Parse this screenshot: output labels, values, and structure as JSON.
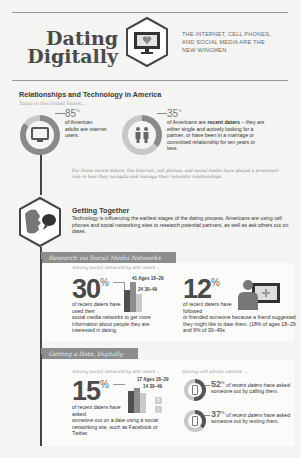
{
  "header": {
    "title_line1": "Dating",
    "title_line2": "Digitally",
    "logo_icon": "monitor-heart-icon",
    "tagline_line1": "THE INTERNET, CELL PHONES,",
    "tagline_line2": "AND SOCIAL MEDIA ARE THE",
    "tagline_line3": "NEW WINGMEN"
  },
  "section1": {
    "title": "Relationships and Technology in America",
    "subtitle": "Today in the United States...",
    "stat1": {
      "value": "85",
      "unit": "%",
      "icon": "monitor-icon",
      "text": "of American adults are internet users."
    },
    "stat2": {
      "value": "35",
      "unit": "%",
      "icon": "couple-icon",
      "text_pre": "of Americans are ",
      "text_bold": "recent daters",
      "text_post": " – they are either single and actively looking for a partner, or have been in a marriage or committed relationship for ten years or less."
    },
    "note": "For these recent daters, the Internet, cell phones, and social media have played a prominent role in how they navigate and manage their romantic relationships."
  },
  "section2": {
    "icon": "face-speech-bubble-icon",
    "title": "Getting Together",
    "text": "Technology is influencing the earliest stages of the dating process. Americans are using cell phones and social networking sites to research potential partners, as well as ask others out on dates."
  },
  "research": {
    "banner": "Research via Social Media Networks",
    "intro": "Among social networking site users ...",
    "stat1": {
      "value": "30",
      "unit": "%",
      "text_short": "of recent daters have used their",
      "text_long": "social media networks to get more information about people they are interested in dating.",
      "bars": [
        {
          "label": "41 Ages 18–29",
          "value": 41
        },
        {
          "label": "24 30–49",
          "value": 24
        }
      ]
    },
    "stat2": {
      "value": "12",
      "unit": "%",
      "icon": "person-screen-icon",
      "text_short": "of recent daters have followed",
      "text_long": "or friended someone because a friend suggested they might like to date them. (18% of ages 18–29 and 9% of 30–49s"
    }
  },
  "getting_date": {
    "banner": "Getting a Date, Digitally",
    "intro_left": "Among social networking site users ...",
    "intro_right": "Among cell phone owners ...",
    "stat1": {
      "value": "15",
      "unit": "%",
      "text_short": "of recent daters have asked",
      "text_long": "someone out on a date using a social networking site, such as Facebook or Twitter.",
      "bars": [
        {
          "label": "17 Ages 18–29",
          "value": 17
        },
        {
          "label": "14 30–49",
          "value": 14
        }
      ],
      "icons": [
        "facebook-icon",
        "twitter-icon"
      ]
    },
    "stat2": {
      "value": "52",
      "unit": "%",
      "icon": "phone-call-icon",
      "text_em": "of recent daters",
      "text": "have asked someone out by calling them."
    },
    "stat3": {
      "value": "37",
      "unit": "%",
      "icon": "phone-text-icon",
      "text_em": "of recent daters",
      "text": "have asked someone out by texting them."
    }
  },
  "colors": {
    "dark": "#4a4a4a",
    "mid": "#8d8d8d",
    "light": "#c9c9c9",
    "accent_line": "#444444"
  }
}
